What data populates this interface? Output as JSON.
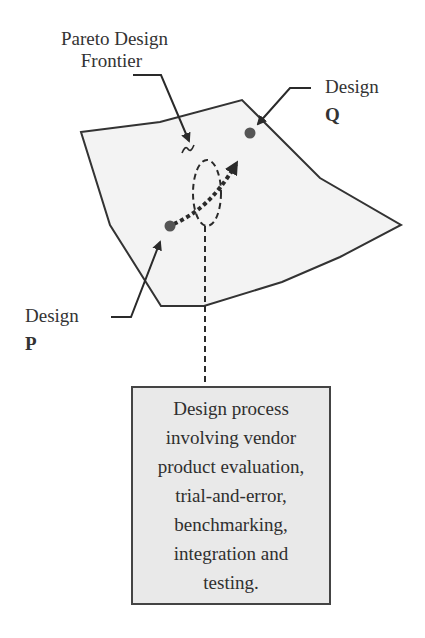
{
  "diagram": {
    "frontier_label": {
      "line1": "Pareto Design",
      "line2": "Frontier"
    },
    "design_q": {
      "line1": "Design",
      "line2": "Q"
    },
    "design_p": {
      "line1": "Design",
      "line2": "P"
    },
    "process_box": {
      "lines": [
        "Design process",
        "involving vendor",
        "product evaluation,",
        "trial-and-error,",
        "benchmarking,",
        "integration and",
        "testing."
      ]
    },
    "colors": {
      "region_fill": "#f2f2f2",
      "outline": "#333333",
      "point": "#555555",
      "box_fill": "#e9e9e9"
    }
  }
}
